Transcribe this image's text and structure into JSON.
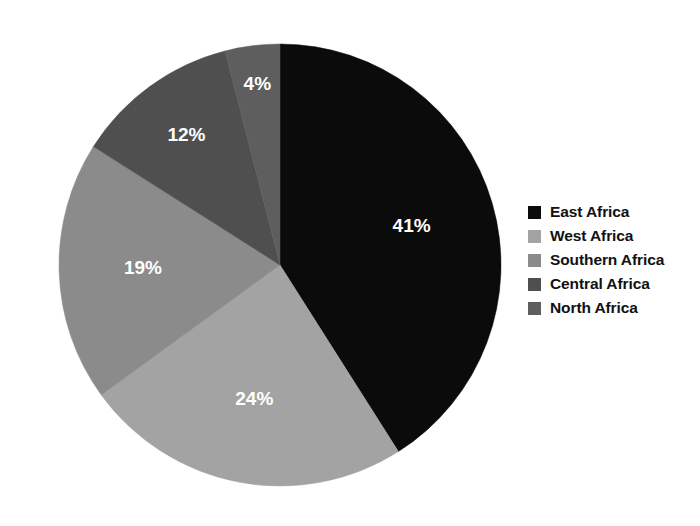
{
  "chart_data": {
    "type": "pie",
    "title": "",
    "subtitle": "",
    "xlabel": "",
    "ylabel": "",
    "legend_position": "right",
    "grid": false,
    "start_angle_deg": 0,
    "direction": "clockwise",
    "categories": [
      "East Africa",
      "West Africa",
      "Southern Africa",
      "Central Africa",
      "North Africa"
    ],
    "values": [
      41,
      24,
      19,
      12,
      4
    ],
    "value_labels": [
      "41%",
      "24%",
      "19%",
      "12%",
      "4%"
    ],
    "colors": [
      "#0b0b0b",
      "#a3a3a3",
      "#8b8b8b",
      "#4f4f4f",
      "#5e5e5e"
    ],
    "slices": [
      {
        "label": "East Africa",
        "value": 41,
        "display": "41%",
        "color": "#0b0b0b",
        "label_color": "#ffffff"
      },
      {
        "label": "West Africa",
        "value": 24,
        "display": "24%",
        "color": "#a3a3a3",
        "label_color": "#ffffff"
      },
      {
        "label": "Southern Africa",
        "value": 19,
        "display": "19%",
        "color": "#8b8b8b",
        "label_color": "#ffffff"
      },
      {
        "label": "Central Africa",
        "value": 12,
        "display": "12%",
        "color": "#4f4f4f",
        "label_color": "#ffffff"
      },
      {
        "label": "North Africa",
        "value": 4,
        "display": "4%",
        "color": "#5e5e5e",
        "label_color": "#ffffff"
      }
    ]
  },
  "pie": {
    "center_x": 280,
    "center_y": 265,
    "radius": 221,
    "label_radius_factor": 0.62,
    "slice_0_label": "41%",
    "slice_1_label": "24%",
    "slice_2_label": "19%",
    "slice_3_label": "12%",
    "slice_4_label": "4%"
  },
  "legend": {
    "items": [
      {
        "label": "East Africa",
        "color": "#0b0b0b",
        "swatch_name": "legend-swatch-east-africa"
      },
      {
        "label": "West Africa",
        "color": "#a3a3a3",
        "swatch_name": "legend-swatch-west-africa"
      },
      {
        "label": "Southern Africa",
        "color": "#8b8b8b",
        "swatch_name": "legend-swatch-southern-africa"
      },
      {
        "label": "Central Africa",
        "color": "#4f4f4f",
        "swatch_name": "legend-swatch-central-africa"
      },
      {
        "label": "North Africa",
        "color": "#5e5e5e",
        "swatch_name": "legend-swatch-north-africa"
      }
    ]
  },
  "background_color": "#ffffff"
}
